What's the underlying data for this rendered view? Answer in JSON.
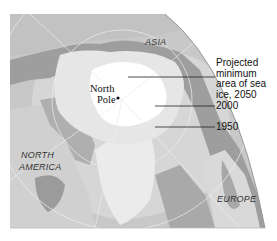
{
  "map": {
    "title": "Arctic sea ice extent",
    "regions": {
      "asia": "ASIA",
      "north_america_line1": "NORTH",
      "north_america_line2": "AMERICA",
      "europe": "EUROPE"
    },
    "pole": {
      "line1": "North",
      "line2": "Pole"
    },
    "legend": [
      {
        "id": "2050",
        "lines": [
          "Projected",
          "minimum",
          "area of sea",
          "ice, 2050"
        ],
        "color": "#ffffff"
      },
      {
        "id": "2000",
        "label": "2000",
        "color": "#e4e4e4"
      },
      {
        "id": "1950",
        "label": "1950",
        "color": "#cfcfcf"
      }
    ],
    "colors": {
      "ocean": "#b9b9b9",
      "land": "#9a9a9a",
      "ice_1950": "#d2d2d2",
      "ice_2000": "#e6e6e6",
      "ice_2050": "#ffffff",
      "outside": "#ffffff",
      "graticule": "#e8e8e8"
    }
  }
}
